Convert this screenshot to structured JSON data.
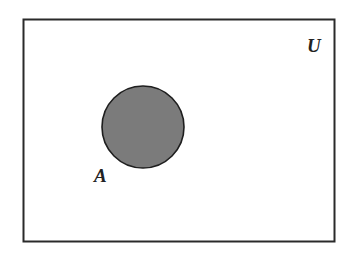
{
  "diagram": {
    "type": "venn",
    "universe": {
      "label": "U",
      "stroke": "#2a2a2a",
      "fill": "#ffffff"
    },
    "sets": [
      {
        "label": "A",
        "fill": "#7b7b7b",
        "stroke": "#1e1e1e",
        "shaded": true
      }
    ]
  }
}
